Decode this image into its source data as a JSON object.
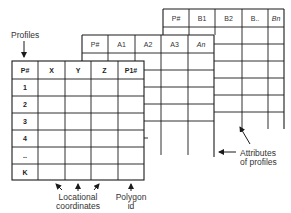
{
  "diagram": {
    "back_table": {
      "name": "Attribute table B",
      "headers": [
        "P#",
        "B1",
        "B2",
        "B..",
        "Bn"
      ]
    },
    "middle_table": {
      "name": "Attribute table A",
      "headers": [
        "P#",
        "A1",
        "A2",
        "A3",
        "An"
      ]
    },
    "front_table": {
      "name": "Profile table",
      "headers": [
        "P#",
        "X",
        "Y",
        "Z",
        "P1#"
      ],
      "row_ids": [
        "1",
        "2",
        "3",
        "4",
        "..",
        "K"
      ]
    },
    "labels": {
      "profiles": "Profiles",
      "locational_line1": "Locational",
      "locational_line2": "coordinates",
      "polygon_line1": "Polygon",
      "polygon_line2": "id",
      "attributes_line1": "Attributes",
      "attributes_line2": "of profiles"
    },
    "colors": {
      "line": "#1a1a1a",
      "text": "#333333",
      "background": "#ffffff"
    }
  }
}
